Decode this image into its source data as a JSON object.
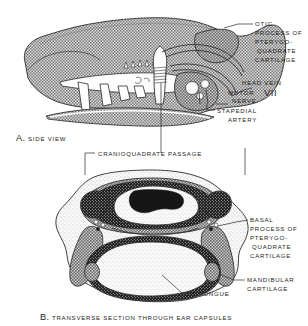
{
  "figure": {
    "background_color": "#ffffff",
    "ink_color": "#1d1d1d",
    "cartilage_gray": "#9a9a9a",
    "capsule_black": "#141414",
    "matrix_stipple": "#efefef"
  },
  "panel_a": {
    "caption_letter": "A.",
    "caption_text": "SIDE VIEW",
    "labels": [
      {
        "id": "otic-process",
        "lines": [
          "OTIC",
          "PROCESS OF",
          "PTERYGO-",
          "QUADRATE",
          "CARTILAGE"
        ]
      },
      {
        "id": "head-vein",
        "lines": [
          "HEAD VEIN"
        ]
      },
      {
        "id": "motor-vii-nerve",
        "lines": [
          "MOTOR",
          "NERVE"
        ],
        "roman": "VII"
      },
      {
        "id": "stapedial-artery",
        "lines": [
          "STAPEDIAL",
          "ARTERY"
        ]
      }
    ]
  },
  "bracket": {
    "label": "CRANIOQUADRATE PASSAGE"
  },
  "panel_b": {
    "caption_letter": "B.",
    "caption_text": "TRANSVERSE SECTION THROUGH EAR CAPSULES",
    "labels": [
      {
        "id": "basal-process",
        "lines": [
          "BASAL",
          "PROCESS OF",
          "PTERYGO-",
          "QUADRATE",
          "CARTILAGE"
        ]
      },
      {
        "id": "mandibular-cartilage",
        "lines": [
          "MANDIBULAR",
          "CARTILAGE"
        ]
      },
      {
        "id": "tongue",
        "lines": [
          "TONGUE"
        ]
      }
    ]
  }
}
